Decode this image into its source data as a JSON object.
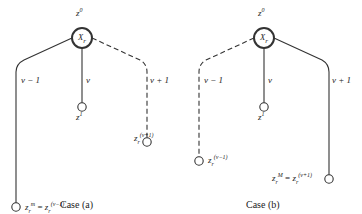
{
  "diagram": {
    "panels": [
      {
        "caption": "Case (a)",
        "root": {
          "top_label": "z",
          "top_sup": "0",
          "inner": "X",
          "inner_sub": "r"
        },
        "branches": [
          {
            "label": "ν − 1",
            "style": "solid",
            "leaf": {
              "lhs_base": "z",
              "lhs_sup": "m",
              "lhs_sub": "r",
              "eq": "=",
              "rhs_base": "z",
              "rhs_sup": "(ν−1)",
              "rhs_sub": "r"
            }
          },
          {
            "label": "ν",
            "style": "solid",
            "leaf": {
              "base": "z",
              "sup": "1"
            }
          },
          {
            "label": "ν + 1",
            "style": "dashed",
            "leaf": {
              "base": "z",
              "sup": "(ν+1)",
              "sub": "r"
            }
          }
        ]
      },
      {
        "caption": "Case (b)",
        "root": {
          "top_label": "z",
          "top_sup": "0",
          "inner": "X",
          "inner_sub": "r"
        },
        "branches": [
          {
            "label": "ν − 1",
            "style": "dashed",
            "leaf": {
              "base": "z",
              "sup": "(ν−1)",
              "sub": "r"
            }
          },
          {
            "label": "ν",
            "style": "solid",
            "leaf": {
              "base": "z",
              "sup": "1"
            }
          },
          {
            "label": "ν + 1",
            "style": "solid",
            "leaf": {
              "lhs_base": "z",
              "lhs_sup": "M",
              "lhs_sub": "r",
              "eq": "=",
              "rhs_base": "z",
              "rhs_sup": "(ν+1)",
              "rhs_sub": "r"
            }
          }
        ]
      }
    ]
  }
}
